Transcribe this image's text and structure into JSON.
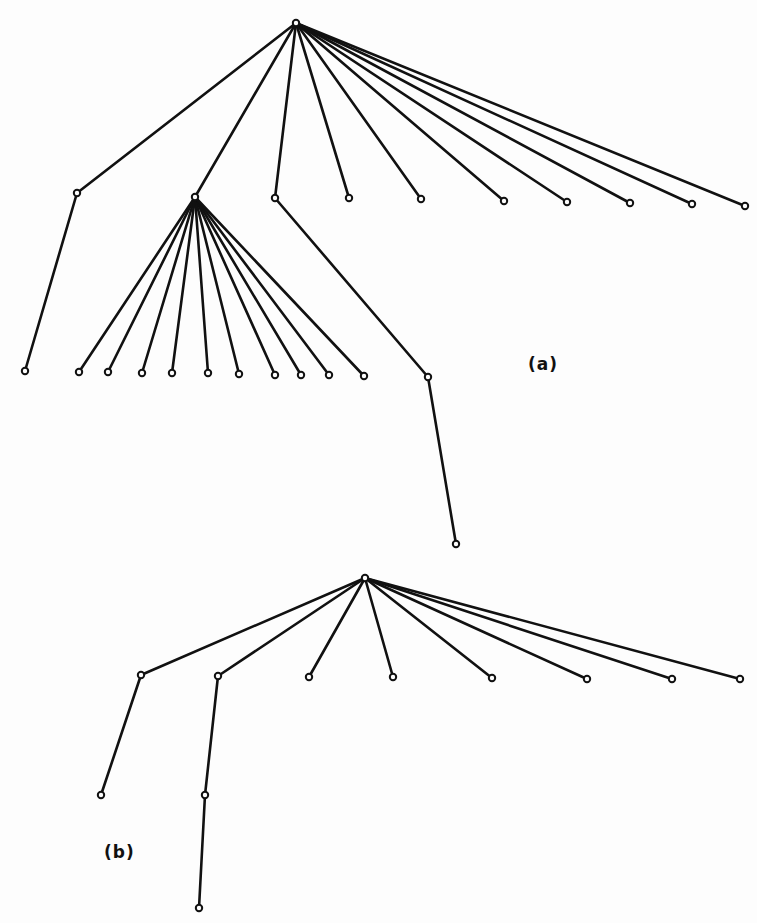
{
  "figure": {
    "width": 757,
    "height": 923,
    "colors": {
      "ink": "#111111",
      "background": "#fdfdfd"
    }
  },
  "labels": {
    "a": {
      "text": "(a)",
      "x": 528,
      "y": 364
    },
    "b": {
      "text": "(b)",
      "x": 104,
      "y": 852
    }
  },
  "trees": [
    {
      "id": "a",
      "nodes": {
        "r": [
          296,
          23
        ],
        "A": [
          77,
          193
        ],
        "B": [
          195,
          197
        ],
        "C": [
          275,
          198
        ],
        "L1": [
          349,
          198
        ],
        "L2": [
          421,
          199
        ],
        "L3": [
          504,
          201
        ],
        "L4": [
          567,
          202
        ],
        "L5": [
          630,
          203
        ],
        "L6": [
          692,
          204
        ],
        "L7": [
          745,
          206
        ],
        "A1": [
          25,
          371
        ],
        "B1": [
          79,
          372
        ],
        "B2": [
          108,
          372
        ],
        "B3": [
          142,
          373
        ],
        "B4": [
          172,
          373
        ],
        "B5": [
          208,
          373
        ],
        "B6": [
          239,
          374
        ],
        "B7": [
          275,
          375
        ],
        "B8": [
          301,
          375
        ],
        "B9": [
          329,
          375
        ],
        "B10": [
          364,
          376
        ],
        "D": [
          428,
          377
        ],
        "D1": [
          456,
          544
        ]
      },
      "edges": [
        [
          "r",
          "A"
        ],
        [
          "r",
          "B"
        ],
        [
          "r",
          "C"
        ],
        [
          "r",
          "L1"
        ],
        [
          "r",
          "L2"
        ],
        [
          "r",
          "L3"
        ],
        [
          "r",
          "L4"
        ],
        [
          "r",
          "L5"
        ],
        [
          "r",
          "L6"
        ],
        [
          "r",
          "L7"
        ],
        [
          "A",
          "A1"
        ],
        [
          "B",
          "B1"
        ],
        [
          "B",
          "B2"
        ],
        [
          "B",
          "B3"
        ],
        [
          "B",
          "B4"
        ],
        [
          "B",
          "B5"
        ],
        [
          "B",
          "B6"
        ],
        [
          "B",
          "B7"
        ],
        [
          "B",
          "B8"
        ],
        [
          "B",
          "B9"
        ],
        [
          "B",
          "B10"
        ],
        [
          "C",
          "D"
        ],
        [
          "D",
          "D1"
        ]
      ]
    },
    {
      "id": "b",
      "nodes": {
        "r": [
          365,
          578
        ],
        "E": [
          141,
          675
        ],
        "F": [
          218,
          676
        ],
        "M1": [
          309,
          677
        ],
        "M2": [
          393,
          677
        ],
        "M3": [
          492,
          678
        ],
        "M4": [
          587,
          679
        ],
        "M5": [
          672,
          679
        ],
        "M6": [
          740,
          679
        ],
        "E1": [
          101,
          795
        ],
        "G": [
          205,
          795
        ],
        "G1": [
          199,
          908
        ]
      },
      "edges": [
        [
          "r",
          "E"
        ],
        [
          "r",
          "F"
        ],
        [
          "r",
          "M1"
        ],
        [
          "r",
          "M2"
        ],
        [
          "r",
          "M3"
        ],
        [
          "r",
          "M4"
        ],
        [
          "r",
          "M5"
        ],
        [
          "r",
          "M6"
        ],
        [
          "E",
          "E1"
        ],
        [
          "F",
          "G"
        ],
        [
          "G",
          "G1"
        ]
      ]
    }
  ]
}
